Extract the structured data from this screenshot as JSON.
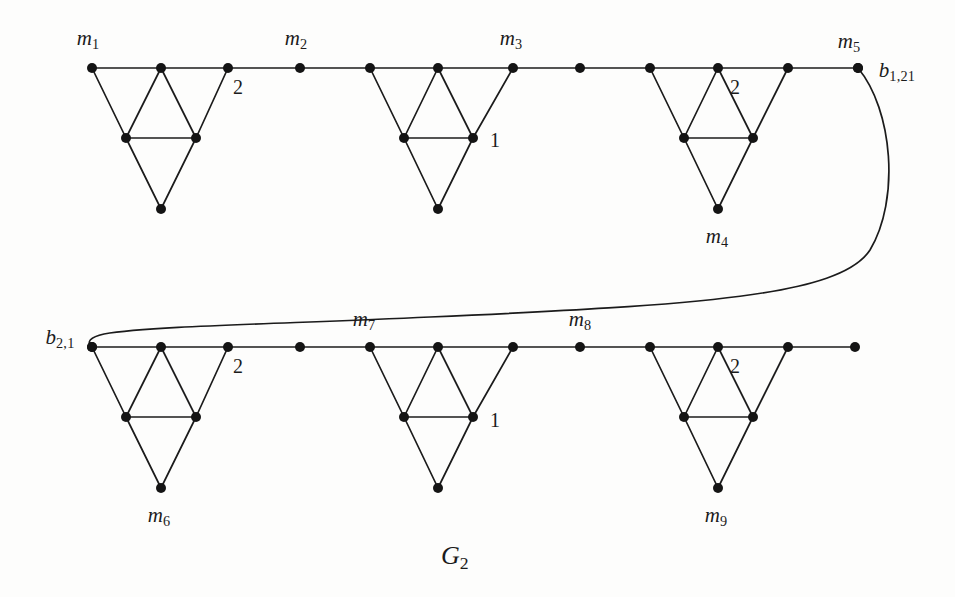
{
  "figure": {
    "caption": "G",
    "caption_sub": "2",
    "stroke_color": "#1b1b1b",
    "vertex_color": "#141414",
    "background": "#fdfdfc"
  },
  "geometry": {
    "top_row_y": 68,
    "top_mid_y": 138,
    "top_apex_y": 209,
    "bottom_row_y": 347,
    "bottom_mid_y": 417,
    "bottom_apex_y": 488,
    "top_path_x": [
      92,
      161,
      228,
      300,
      370,
      438,
      513,
      580,
      650,
      718,
      788,
      858
    ],
    "bottom_path_x": [
      92,
      161,
      228,
      300,
      370,
      438,
      513,
      580,
      650,
      718,
      788,
      855
    ],
    "top_gadgets": [
      {
        "left": 92,
        "apex": 161,
        "right": 228,
        "mid_left": 126,
        "mid_right": 196,
        "bottom": 161
      },
      {
        "left": 370,
        "apex": 438,
        "right": 513,
        "mid_left": 404,
        "mid_right": 473,
        "bottom": 438
      },
      {
        "left": 650,
        "apex": 718,
        "right": 788,
        "mid_left": 684,
        "mid_right": 753,
        "bottom": 718
      }
    ],
    "bottom_gadgets": [
      {
        "left": 92,
        "apex": 161,
        "right": 228,
        "mid_left": 126,
        "mid_right": 196,
        "bottom": 161
      },
      {
        "left": 370,
        "apex": 438,
        "right": 513,
        "mid_left": 404,
        "mid_right": 473,
        "bottom": 438
      },
      {
        "left": 650,
        "apex": 718,
        "right": 788,
        "mid_left": 684,
        "mid_right": 753,
        "bottom": 718
      }
    ],
    "connector_path": "M 858 68 C 893 110 900 200 870 250 C 840 296 700 305 430 317 C 280 324 150 326 104 334 C 90 337 86 342 92 347"
  },
  "labels": {
    "m1": {
      "text": "m",
      "sub": "1",
      "x": 88,
      "y": 40
    },
    "m2": {
      "text": "m",
      "sub": "2",
      "x": 296,
      "y": 40
    },
    "m3": {
      "text": "m",
      "sub": "3",
      "x": 511,
      "y": 40
    },
    "m5": {
      "text": "m",
      "sub": "5",
      "x": 849,
      "y": 43
    },
    "m4": {
      "text": "m",
      "sub": "4",
      "x": 717,
      "y": 238
    },
    "m6": {
      "text": "m",
      "sub": "6",
      "x": 159,
      "y": 517
    },
    "m7": {
      "text": "m",
      "sub": "7",
      "x": 364,
      "y": 321
    },
    "m8": {
      "text": "m",
      "sub": "8",
      "x": 580,
      "y": 321
    },
    "m9": {
      "text": "m",
      "sub": "9",
      "x": 716,
      "y": 517
    },
    "b_top": {
      "text": "b",
      "sub": "1,21",
      "x": 897,
      "y": 72
    },
    "b_bottom": {
      "text": "b",
      "sub": "2,1",
      "x": 60,
      "y": 339
    }
  },
  "weights": [
    {
      "value": "2",
      "x": 238,
      "y": 87,
      "name": "weight-top-gadget-1"
    },
    {
      "value": "1",
      "x": 495,
      "y": 140,
      "name": "weight-top-gadget-2"
    },
    {
      "value": "2",
      "x": 735,
      "y": 87,
      "name": "weight-top-gadget-3"
    },
    {
      "value": "2",
      "x": 238,
      "y": 366,
      "name": "weight-bottom-gadget-1"
    },
    {
      "value": "1",
      "x": 495,
      "y": 420,
      "name": "weight-bottom-gadget-2"
    },
    {
      "value": "2",
      "x": 735,
      "y": 366,
      "name": "weight-bottom-gadget-3"
    }
  ]
}
